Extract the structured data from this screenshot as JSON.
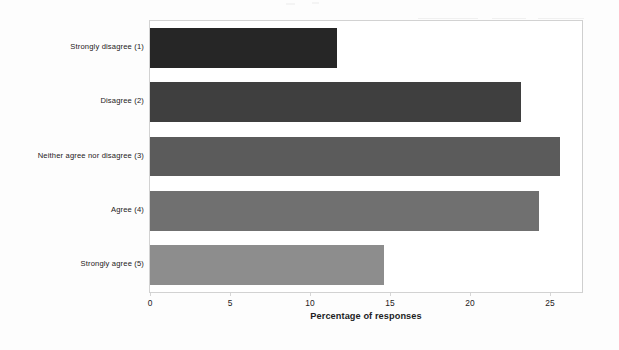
{
  "chart_data": {
    "type": "bar",
    "orientation": "horizontal",
    "title": "",
    "subtitle": "",
    "xlabel": "Percentage of responses",
    "ylabel": "",
    "categories": [
      "Strongly disagree (1)",
      "Disagree (2)",
      "Neither agree nor disagree (3)",
      "Agree (4)",
      "Strongly agree (5)"
    ],
    "values": [
      11.7,
      23.2,
      25.6,
      24.3,
      14.6
    ],
    "bar_colors": [
      "#262626",
      "#3f3f3f",
      "#5b5b5b",
      "#707070",
      "#8d8d8d"
    ],
    "xlim": [
      0,
      27.0
    ],
    "x_ticks": [
      0,
      5,
      10,
      15,
      20,
      25
    ],
    "x_tick_labels": [
      "0",
      "5",
      "10",
      "15",
      "20",
      "25"
    ],
    "grid": false,
    "legend": false,
    "legend_position": "none",
    "plot_border_color": "#d2d2d2",
    "background_color": "#ffffff"
  }
}
